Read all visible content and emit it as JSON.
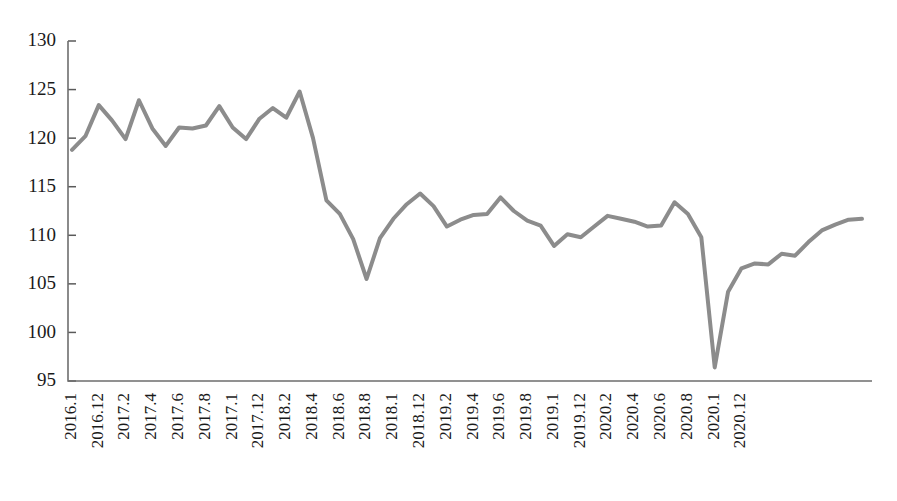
{
  "chart_data": {
    "type": "line",
    "title": "",
    "subtitle": "",
    "xlabel": "",
    "ylabel": "",
    "ylim": [
      95,
      130
    ],
    "yticks": [
      95,
      100,
      105,
      110,
      115,
      120,
      125,
      130
    ],
    "ytick_labels": [
      "95",
      "100",
      "105",
      "110",
      "115",
      "120",
      "125",
      "130"
    ],
    "grid": false,
    "legend": false,
    "legend_position": "none",
    "line_color": "#8c8c8c",
    "line_width": 4,
    "axis_color": "#6e6e6e",
    "text_color": "#1a1a1a",
    "background_color": "#ffffff",
    "xtick_labels": [
      "2016.1",
      "2016.12",
      "2017.2",
      "2017.4",
      "2017.6",
      "2017.8",
      "2017.1",
      "2017.12",
      "2018.2",
      "2018.4",
      "2018.6",
      "2018.8",
      "2018.1",
      "2018.12",
      "2019.2",
      "2019.4",
      "2019.6",
      "2019.8",
      "2019.1",
      "2019.12",
      "2020.2",
      "2020.4",
      "2020.6",
      "2020.8",
      "2020.1",
      "2020.12"
    ],
    "xtick_indices": [
      0,
      2,
      4,
      6,
      8,
      10,
      12,
      14,
      16,
      18,
      20,
      22,
      24,
      26,
      28,
      30,
      32,
      34,
      36,
      38,
      40,
      42,
      44,
      46,
      48,
      50
    ],
    "x": [
      "2016.1",
      "2016.2",
      "2016.3",
      "2016.4",
      "2016.5",
      "2016.6",
      "2016.7",
      "2016.8",
      "2016.9",
      "2016.10",
      "2016.11",
      "2016.12",
      "2017.1",
      "2017.2",
      "2017.3",
      "2017.4",
      "2017.5",
      "2017.6",
      "2017.7",
      "2017.8",
      "2017.9",
      "2017.10",
      "2017.11",
      "2017.12",
      "2018.1",
      "2018.2",
      "2018.3",
      "2018.4",
      "2018.5",
      "2018.6",
      "2018.7",
      "2018.8",
      "2018.9",
      "2018.10",
      "2018.11",
      "2018.12",
      "2019.1",
      "2019.2",
      "2019.3",
      "2019.4",
      "2019.5",
      "2019.6",
      "2019.7",
      "2019.8",
      "2019.9",
      "2019.10",
      "2019.11",
      "2019.12",
      "2020.1",
      "2020.2",
      "2020.3",
      "2020.4",
      "2020.5",
      "2020.6",
      "2020.7",
      "2020.8",
      "2020.9",
      "2020.10",
      "2020.11",
      "2020.12"
    ],
    "values": [
      118.8,
      120.2,
      123.4,
      121.8,
      119.9,
      123.9,
      121.0,
      119.2,
      121.1,
      121.0,
      121.3,
      123.3,
      121.1,
      119.9,
      122.0,
      123.1,
      122.1,
      124.8,
      120.0,
      113.6,
      112.2,
      109.6,
      105.5,
      109.7,
      111.7,
      113.2,
      114.3,
      113.0,
      110.9,
      111.6,
      112.1,
      112.2,
      113.9,
      112.5,
      111.5,
      111.0,
      108.9,
      110.1,
      109.8,
      110.9,
      112.0,
      111.7,
      111.4,
      110.9,
      111.0,
      113.4,
      112.2,
      109.8,
      96.4,
      104.2,
      106.6,
      107.1,
      107.0,
      108.1,
      107.9,
      109.3,
      110.5,
      111.1,
      111.6,
      111.7
    ],
    "series": [
      {
        "name": "index",
        "color": "#8c8c8c",
        "values": [
          118.8,
          120.2,
          123.4,
          121.8,
          119.9,
          123.9,
          121.0,
          119.2,
          121.1,
          121.0,
          121.3,
          123.3,
          121.1,
          119.9,
          122.0,
          123.1,
          122.1,
          124.8,
          120.0,
          113.6,
          112.2,
          109.6,
          105.5,
          109.7,
          111.7,
          113.2,
          114.3,
          113.0,
          110.9,
          111.6,
          112.1,
          112.2,
          113.9,
          112.5,
          111.5,
          111.0,
          108.9,
          110.1,
          109.8,
          110.9,
          112.0,
          111.7,
          111.4,
          110.9,
          111.0,
          113.4,
          112.2,
          109.8,
          96.4,
          104.2,
          106.6,
          107.1,
          107.0,
          108.1,
          107.9,
          109.3,
          110.5,
          111.1,
          111.6,
          111.7
        ]
      }
    ],
    "annotations": []
  },
  "plot_geometry": {
    "left": 68,
    "right": 872,
    "top": 41,
    "bottom": 381
  }
}
